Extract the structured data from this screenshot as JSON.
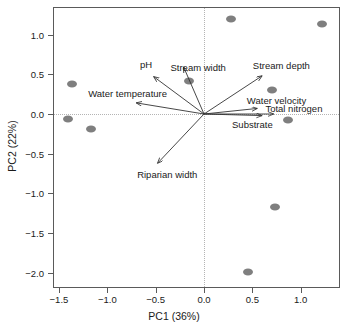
{
  "chart_data": {
    "type": "scatter",
    "title": "",
    "xlabel": "PC1 (36%)",
    "ylabel": "PC2 (22%)",
    "xlim": [
      -1.62,
      1.35
    ],
    "ylim": [
      -2.18,
      1.38
    ],
    "xticks": [
      -1.5,
      -1.0,
      -0.5,
      0.0,
      0.5,
      1.0
    ],
    "xticklabels": [
      "−1.5",
      "−1.0",
      "−0.5",
      "0.0",
      "0.5",
      "1.0"
    ],
    "yticks": [
      1.0,
      0.5,
      0.0,
      -0.5,
      -1.0,
      -1.5,
      -2.0
    ],
    "yticklabels": [
      "1.0",
      "0.5",
      "0.0",
      "−0.5",
      "−1.0",
      "−1.5",
      "−2.0"
    ],
    "grid": false,
    "reference_lines": {
      "horizontal": 0.0,
      "vertical": 0.0,
      "style": "dotted",
      "color": "#b4b4b4"
    },
    "legend": "none",
    "point_color": "#7f7f7f",
    "points": [
      {
        "x": -1.37,
        "y": 0.38
      },
      {
        "x": -1.41,
        "y": -0.06
      },
      {
        "x": -1.17,
        "y": -0.19
      },
      {
        "x": -0.16,
        "y": 0.42
      },
      {
        "x": 0.28,
        "y": 1.2
      },
      {
        "x": 1.22,
        "y": 1.13
      },
      {
        "x": 0.7,
        "y": 0.3
      },
      {
        "x": 0.87,
        "y": -0.07
      },
      {
        "x": 0.73,
        "y": -1.17
      },
      {
        "x": 0.46,
        "y": -1.99
      }
    ],
    "vectors": [
      {
        "name": "pH",
        "x": -0.52,
        "y": 0.47,
        "label": "pH",
        "label_x": -0.6,
        "label_y": 0.63,
        "label_anchor": "middle"
      },
      {
        "name": "Stream width",
        "x": -0.21,
        "y": 0.59,
        "label": "Stream width",
        "label_x": -0.06,
        "label_y": 0.59,
        "label_anchor": "middle"
      },
      {
        "name": "Water temperature",
        "x": -0.7,
        "y": 0.14,
        "label": "Water temperature",
        "label_x": -0.79,
        "label_y": 0.26,
        "label_anchor": "middle"
      },
      {
        "name": "Stream depth",
        "x": 0.6,
        "y": 0.48,
        "label": "Stream depth",
        "label_x": 0.8,
        "label_y": 0.62,
        "label_anchor": "middle"
      },
      {
        "name": "Water velocity",
        "x": 0.55,
        "y": 0.07,
        "label": "Water velocity",
        "label_x": 0.75,
        "label_y": 0.18,
        "label_anchor": "middle"
      },
      {
        "name": "Total nitrogen",
        "x": 0.72,
        "y": 0.0,
        "label": "Total nitrogen",
        "label_x": 0.93,
        "label_y": 0.08,
        "label_anchor": "middle"
      },
      {
        "name": "Substrate",
        "x": 0.6,
        "y": -0.02,
        "label": "Substrate",
        "label_x": 0.5,
        "label_y": -0.12,
        "label_anchor": "middle"
      },
      {
        "name": "Riparian width",
        "x": -0.48,
        "y": -0.62,
        "label": "Riparian width",
        "label_x": -0.38,
        "label_y": -0.76,
        "label_anchor": "middle"
      }
    ],
    "arrow_color": "#333333"
  },
  "axes": {
    "x_axis_title": "PC1 (36%)",
    "y_axis_title": "PC2 (22%)"
  }
}
